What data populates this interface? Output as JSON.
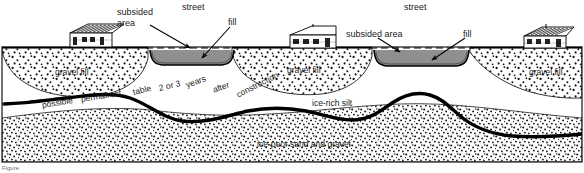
{
  "figure": {
    "caption": "Figure",
    "width": 584,
    "height": 173
  },
  "colors": {
    "ink": "#000000",
    "paper": "#ffffff",
    "fill_asphalt": "#8f8f8f",
    "stipple": "#111111",
    "label": "#1a1a1a"
  },
  "labels": {
    "subsided_area_left_line1": "subsided",
    "subsided_area_left_line2": "area",
    "street_left": "street",
    "fill_left": "fill",
    "street_right": "street",
    "subsided_area_right": "subsided area",
    "fill_right": "fill",
    "gravel_fill_1": "gravel fill",
    "gravel_fill_2": "gravel fill",
    "gravel_fill_3": "gravel fill",
    "permafrost_table": "possible permafrost table 2 or 3 years after construction",
    "ice_rich_silt": "ice-rich silt",
    "ice_poor_sand_gravel": "ice-poor sand and gravel"
  },
  "permafrost_label_words": {
    "w1": "possible",
    "w2": "permafrost",
    "w3": "table",
    "w4": "2 or 3",
    "w5": "years",
    "w6": "after",
    "w7": "construction"
  },
  "strata": [
    {
      "name": "gravel-fill",
      "pattern": "coarse-stipple",
      "description": "gravel fill wedges beneath houses"
    },
    {
      "name": "ice-rich-silt",
      "pattern": "blank",
      "description": "ice-rich silt layer"
    },
    {
      "name": "ice-poor-sand-and-gravel",
      "pattern": "dense-stipple",
      "description": "ice-poor sand and gravel basal unit"
    }
  ],
  "features": {
    "houses": 3,
    "streets": 2,
    "subsided_areas": 2,
    "original_grade_style": "dashed"
  }
}
